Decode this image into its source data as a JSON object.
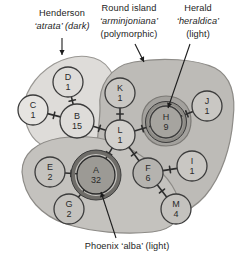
{
  "figure": {
    "type": "haplotype-network",
    "title_visible": false
  },
  "annotations": [
    {
      "id": "henderson",
      "lines": [
        {
          "text": "Henderson",
          "italic": false
        },
        {
          "text": "‘atrata’ (dark)",
          "italic": true
        }
      ],
      "x": 62,
      "y": 14,
      "line_height": 13,
      "arrow": {
        "x1": 62,
        "y1": 38,
        "x2": 62,
        "y2": 55
      }
    },
    {
      "id": "round-island",
      "lines": [
        {
          "text": "Round island",
          "italic": false
        },
        {
          "text": "‘arminjoniana’",
          "italic": true
        },
        {
          "text": "(polymorphic)",
          "italic": false
        }
      ],
      "x": 129,
      "y": 9,
      "line_height": 13,
      "arrow": {
        "x1": 135,
        "y1": 44,
        "x2": 144,
        "y2": 62
      }
    },
    {
      "id": "herald",
      "lines": [
        {
          "text": "Herald",
          "italic": false
        },
        {
          "text": "‘heraldica’",
          "italic": true
        },
        {
          "text": "(light)",
          "italic": false
        }
      ],
      "x": 198,
      "y": 9,
      "line_height": 13,
      "arrow": {
        "x1": 190,
        "y1": 44,
        "x2": 168,
        "y2": 108
      }
    },
    {
      "id": "phoenix",
      "lines": [
        {
          "text": "Phoenix ‘alba’ (light)",
          "italic": false
        }
      ],
      "x": 127,
      "y": 247,
      "line_height": 13,
      "arrow": {
        "x1": 116,
        "y1": 238,
        "x2": 101,
        "y2": 192
      }
    }
  ],
  "regions": [
    {
      "id": "henderson-region",
      "label": "Henderson 'atrata' (dark)",
      "fill": "#dedcd9",
      "stroke": "#9a9894",
      "path": "M 24,113 C 22,96 34,76 54,64 C 76,52 100,54 110,70 C 122,88 121,112 110,126 C 98,142 72,152 50,148 C 32,144 26,128 24,113 Z"
    },
    {
      "id": "round-island-region",
      "label": "Round island 'arminjoniana' (polymorphic)",
      "fill": "#bdbbb7",
      "stroke": "#8d8b87",
      "path": "M 100,108 C 98,86 110,66 134,62 C 162,57 196,59 215,68 C 232,77 236,96 233,120 C 231,146 222,176 205,196 C 190,213 165,222 142,218 C 118,214 102,196 98,172 C 94,148 100,126 100,108 Z"
    },
    {
      "id": "phoenix-region",
      "label": "Phoenix 'alba' (light)",
      "fill": "#c4c2be",
      "stroke": "#8d8b87",
      "path": "M 22,172 C 22,154 36,142 60,138 C 86,134 112,138 132,150 C 154,163 172,180 178,198 C 184,216 174,230 152,232 C 124,235 92,232 66,224 C 42,216 24,198 22,172 Z"
    },
    {
      "id": "herald-region",
      "label": "Herald 'heraldica' (light)",
      "fill": "#a3a19d",
      "stroke": "#7b7975",
      "path": "M 142,120 C 142,106 152,96 166,96 C 181,96 191,106 191,121 C 191,136 181,146 166,146 C 152,146 142,136 142,120 Z"
    }
  ],
  "nodes": [
    {
      "id": "D",
      "label": "D",
      "count": "1",
      "cx": 68,
      "cy": 82,
      "r": 15,
      "fill": "#dedcd9",
      "stroke": "#3b3b3b",
      "halo": false
    },
    {
      "id": "C",
      "label": "C",
      "count": "1",
      "cx": 33,
      "cy": 110,
      "r": 15,
      "fill": "#e6e4e1",
      "stroke": "#3b3b3b",
      "halo": false
    },
    {
      "id": "B",
      "label": "B",
      "count": "15",
      "cx": 77,
      "cy": 121,
      "r": 17,
      "fill": "#dedcd9",
      "stroke": "#3b3b3b",
      "halo": false
    },
    {
      "id": "K",
      "label": "K",
      "count": "1",
      "cx": 120,
      "cy": 93,
      "r": 15,
      "fill": "#c9c7c3",
      "stroke": "#3b3b3b",
      "halo": false
    },
    {
      "id": "L",
      "label": "L",
      "count": "1",
      "cx": 120,
      "cy": 135,
      "r": 15,
      "fill": "#d2d0cc",
      "stroke": "#3b3b3b",
      "halo": false
    },
    {
      "id": "H",
      "label": "H",
      "count": "9",
      "cx": 166,
      "cy": 122,
      "r": 16,
      "fill": "#a6a49f",
      "stroke": "#3b3b3b",
      "halo": true,
      "halo_color": "#8d8b86",
      "halo_w": 3
    },
    {
      "id": "J",
      "label": "J",
      "count": "1",
      "cx": 207,
      "cy": 106,
      "r": 15,
      "fill": "#c9c7c3",
      "stroke": "#3b3b3b",
      "halo": false
    },
    {
      "id": "E",
      "label": "E",
      "count": "2",
      "cx": 50,
      "cy": 172,
      "r": 15,
      "fill": "#c4c2be",
      "stroke": "#3b3b3b",
      "halo": false
    },
    {
      "id": "A",
      "label": "A",
      "count": "32",
      "cx": 96,
      "cy": 175,
      "r": 19,
      "fill": "#9c9a95",
      "stroke": "#2b2b2b",
      "halo": true,
      "halo_color": "#6e6c68",
      "halo_w": 4
    },
    {
      "id": "G",
      "label": "G",
      "count": "2",
      "cx": 69,
      "cy": 209,
      "r": 15,
      "fill": "#c4c2be",
      "stroke": "#3b3b3b",
      "halo": false
    },
    {
      "id": "F",
      "label": "F",
      "count": "6",
      "cx": 148,
      "cy": 173,
      "r": 15,
      "fill": "#b5b3af",
      "stroke": "#3b3b3b",
      "halo": false
    },
    {
      "id": "I",
      "label": "I",
      "count": "1",
      "cx": 192,
      "cy": 166,
      "r": 15,
      "fill": "#c9c7c3",
      "stroke": "#3b3b3b",
      "halo": false
    },
    {
      "id": "M",
      "label": "M",
      "count": "4",
      "cx": 176,
      "cy": 209,
      "r": 15,
      "fill": "#c4c2be",
      "stroke": "#3b3b3b",
      "halo": false
    }
  ],
  "edges": [
    {
      "from": "D",
      "to": "B",
      "ticks": 1
    },
    {
      "from": "C",
      "to": "B",
      "ticks": 1
    },
    {
      "from": "B",
      "to": "L",
      "ticks": 1
    },
    {
      "from": "K",
      "to": "L",
      "ticks": 1
    },
    {
      "from": "L",
      "to": "H",
      "ticks": 1
    },
    {
      "from": "H",
      "to": "J",
      "ticks": 1
    },
    {
      "from": "L",
      "to": "A",
      "ticks": 1
    },
    {
      "from": "L",
      "to": "F",
      "ticks": 1
    },
    {
      "from": "E",
      "to": "A",
      "ticks": 1
    },
    {
      "from": "G",
      "to": "A",
      "ticks": 1
    },
    {
      "from": "F",
      "to": "I",
      "ticks": 1
    },
    {
      "from": "F",
      "to": "M",
      "ticks": 1
    }
  ],
  "colors": {
    "node_stroke": "#3b3b3b",
    "edge": "#2e2e2e",
    "text": "#1d1d1d",
    "background": "#ffffff"
  }
}
